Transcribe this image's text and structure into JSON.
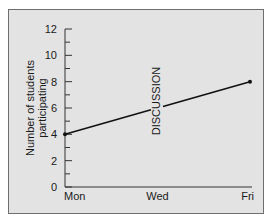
{
  "chart_data": {
    "type": "line",
    "title": "",
    "xlabel": "",
    "ylabel": "Number of students participating",
    "ylabel_lines": [
      "Number of students",
      "participating"
    ],
    "categories": [
      "Mon",
      "Wed",
      "Fri"
    ],
    "x": [
      "Mon",
      "Fri"
    ],
    "series": [
      {
        "name": "Participation",
        "values": [
          4,
          8
        ],
        "x": [
          "Mon",
          "Fri"
        ]
      }
    ],
    "ylim": [
      0,
      12
    ],
    "yticks": [
      0,
      2,
      4,
      6,
      8,
      10,
      12
    ],
    "yticks_minor": [
      1,
      3,
      5,
      7,
      9,
      11
    ],
    "annotations": [
      {
        "text": "DISCUSSION",
        "x": "Wed",
        "orientation": "vertical"
      }
    ],
    "grid": false,
    "legend": null,
    "colors": {
      "background": "#e3e3e3",
      "line": "#111111",
      "border": "#6e6e6e"
    }
  }
}
